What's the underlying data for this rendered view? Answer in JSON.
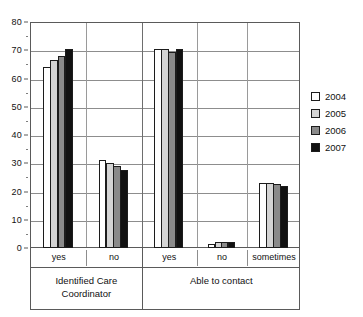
{
  "chart_data": {
    "type": "bar",
    "title": "",
    "xlabel": "",
    "ylabel": "",
    "ylim": [
      0,
      80
    ],
    "yticks": [
      0,
      10,
      20,
      30,
      40,
      50,
      60,
      70,
      80
    ],
    "grid": true,
    "legend_position": "right",
    "categories": [
      "yes",
      "no",
      "yes",
      "no",
      "sometimes"
    ],
    "group_labels": [
      "Identified Care Coordinator",
      "Able to contact"
    ],
    "groups": [
      {
        "name": "Identified Care Coordinator",
        "categories": [
          "yes",
          "no"
        ]
      },
      {
        "name": "Able to contact",
        "categories": [
          "yes",
          "no",
          "sometimes"
        ]
      }
    ],
    "series": [
      {
        "name": "2004",
        "color": "#ffffff",
        "values": [
          64,
          31,
          70.5,
          1.5,
          23
        ]
      },
      {
        "name": "2005",
        "color": "#d4d4d4",
        "values": [
          66.5,
          30,
          70.5,
          2,
          23
        ]
      },
      {
        "name": "2006",
        "color": "#8a8a8a",
        "values": [
          68,
          29,
          69.5,
          2,
          22.5
        ]
      },
      {
        "name": "2007",
        "color": "#111111",
        "values": [
          70.5,
          27.5,
          70.5,
          2,
          22
        ]
      }
    ]
  },
  "axis": {
    "y_tick_labels": [
      "80",
      "70",
      "60",
      "50",
      "40",
      "30",
      "20",
      "10",
      "0"
    ],
    "category_labels": [
      "yes",
      "no",
      "yes",
      "no",
      "sometimes"
    ],
    "group_label_1_line1": "Identified Care",
    "group_label_1_line2": "Coordinator",
    "group_label_2_line1": "Able to contact"
  },
  "legend": {
    "items": [
      {
        "label": "2004",
        "color": "#ffffff"
      },
      {
        "label": "2005",
        "color": "#d4d4d4"
      },
      {
        "label": "2006",
        "color": "#8a8a8a"
      },
      {
        "label": "2007",
        "color": "#111111"
      }
    ]
  }
}
